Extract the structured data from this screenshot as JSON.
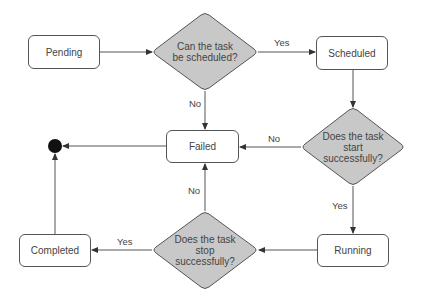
{
  "diagram": {
    "type": "flowchart",
    "colors": {
      "line": "#555555",
      "decision_fill": "#c8c8c8",
      "node_fill": "#ffffff",
      "text": "#444444",
      "end_node": "#111111"
    },
    "states": {
      "pending": "Pending",
      "scheduled": "Scheduled",
      "failed": "Failed",
      "running": "Running",
      "completed": "Completed"
    },
    "decisions": {
      "can_schedule": {
        "line1": "Can the task",
        "line2": "be scheduled?"
      },
      "start_success": {
        "line1": "Does the task",
        "line2": "start",
        "line3": "successfully?"
      },
      "stop_success": {
        "line1": "Does the task",
        "line2": "stop",
        "line3": "successfully?"
      }
    },
    "edge_labels": {
      "schedule_yes": "Yes",
      "schedule_no": "No",
      "start_no": "No",
      "start_yes": "Yes",
      "stop_no": "No",
      "stop_yes": "Yes"
    },
    "edges": [
      {
        "from": "Pending",
        "to": "Can the task be scheduled?",
        "label": ""
      },
      {
        "from": "Can the task be scheduled?",
        "to": "Scheduled",
        "label": "Yes"
      },
      {
        "from": "Can the task be scheduled?",
        "to": "Failed",
        "label": "No"
      },
      {
        "from": "Scheduled",
        "to": "Does the task start successfully?",
        "label": ""
      },
      {
        "from": "Does the task start successfully?",
        "to": "Failed",
        "label": "No"
      },
      {
        "from": "Does the task start successfully?",
        "to": "Running",
        "label": "Yes"
      },
      {
        "from": "Running",
        "to": "Does the task stop successfully?",
        "label": ""
      },
      {
        "from": "Does the task stop successfully?",
        "to": "Failed",
        "label": "No"
      },
      {
        "from": "Does the task stop successfully?",
        "to": "Completed",
        "label": "Yes"
      },
      {
        "from": "Failed",
        "to": "End",
        "label": ""
      },
      {
        "from": "Completed",
        "to": "End",
        "label": ""
      }
    ]
  }
}
